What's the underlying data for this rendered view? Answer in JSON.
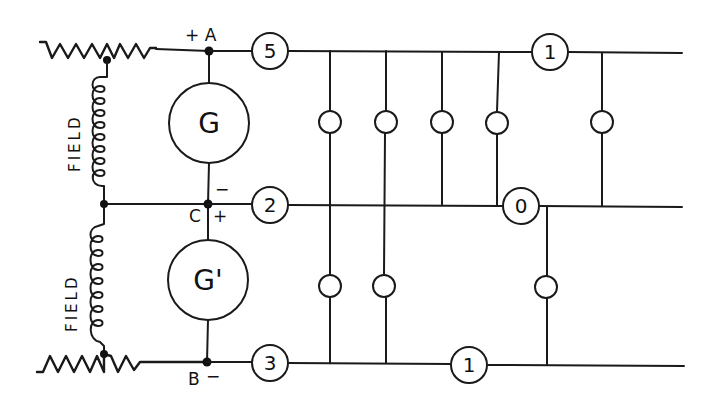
{
  "diagram": {
    "type": "electrical-schematic",
    "generators": [
      {
        "id": "G",
        "label": "G"
      },
      {
        "id": "G_prime",
        "label": "G'"
      }
    ],
    "field_labels": [
      "FIELD",
      "FIELD"
    ],
    "terminals": {
      "A": {
        "label": "+ A"
      },
      "C": {
        "label": "C",
        "minus": "−",
        "plus": "+"
      },
      "B": {
        "label": "B",
        "minus": "−"
      }
    },
    "line_badges": {
      "top_left": "5",
      "middle_left": "2",
      "bottom_left": "3",
      "top_right": "1",
      "middle_right": "0",
      "bottom_right": "1"
    },
    "lamps": {
      "upper": 5,
      "lower": 3
    },
    "colors": {
      "line": "#1a1a1a",
      "background": "#ffffff"
    }
  }
}
